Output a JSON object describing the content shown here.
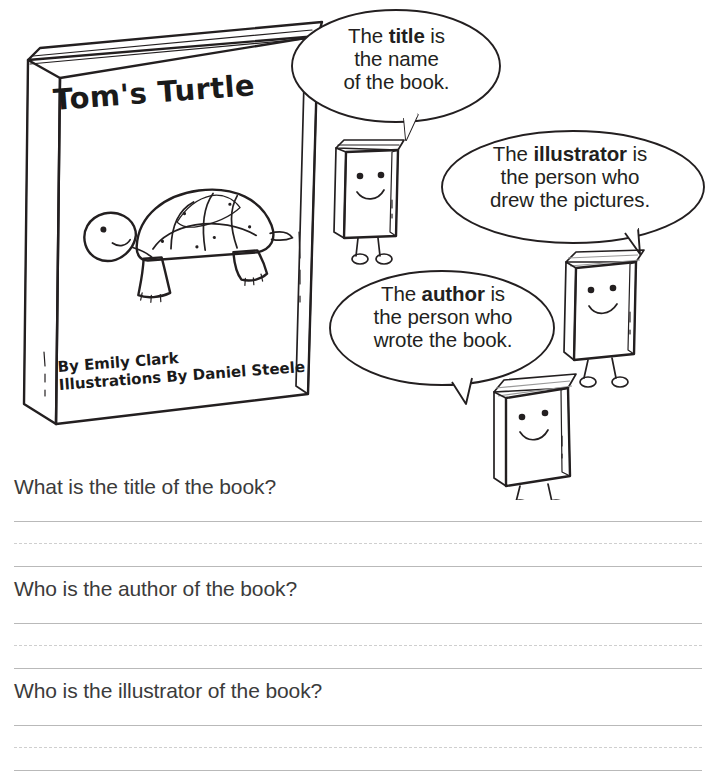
{
  "worksheet": {
    "book_cover": {
      "title": "Tom's Turtle",
      "author_credit": "By Emily Clark",
      "illustrator_credit": "Illustrations By Daniel Steele",
      "cover_art": "turtle-illustration",
      "cover_color": "#eceaea"
    },
    "speech_bubbles": [
      {
        "name": "title-bubble",
        "line1_pre": "The ",
        "line1_bold": "title",
        "line1_post": " is",
        "line2": "the name",
        "line3": "of the book."
      },
      {
        "name": "illustrator-bubble",
        "line1_pre": "The ",
        "line1_bold": "illustrator",
        "line1_post": " is",
        "line2": "the person who",
        "line3": "drew the pictures."
      },
      {
        "name": "author-bubble",
        "line1_pre": "The ",
        "line1_bold": "author",
        "line1_post": " is",
        "line2": "the person who",
        "line3": "wrote the book."
      }
    ],
    "book_characters": [
      {
        "name": "book-character-title",
        "expression": "smiling",
        "top_edge": "light"
      },
      {
        "name": "book-character-illustrator",
        "expression": "smiling",
        "top_edge": "dark"
      },
      {
        "name": "book-character-author",
        "expression": "smiling",
        "top_edge": "dark"
      }
    ],
    "questions": [
      {
        "name": "question-title",
        "text": "What is the title of the book?"
      },
      {
        "name": "question-author",
        "text": "Who is the author of the book?"
      },
      {
        "name": "question-illustrator",
        "text": "Who is the illustrator of the book?"
      }
    ],
    "colors": {
      "ink": "#231f20",
      "question_text": "#3b3b3b",
      "rule_solid": "#b9b9b9",
      "rule_dashed": "#cfcfcf",
      "book_gray": "#b3b2b2",
      "shell_gray": "#9d9c9c",
      "page_background": "#ffffff"
    }
  }
}
